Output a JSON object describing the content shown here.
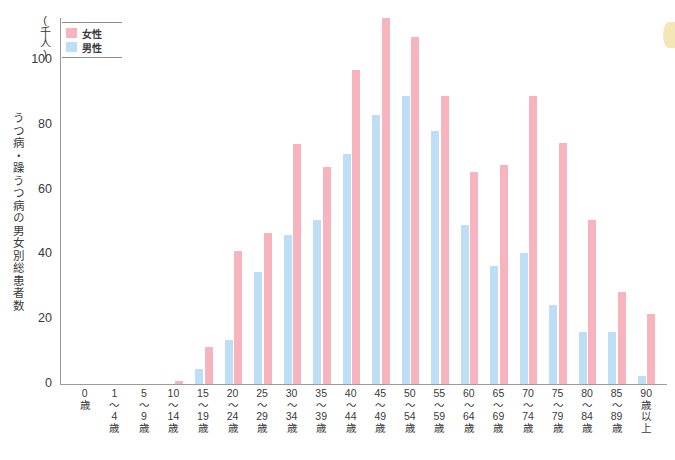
{
  "chart_data": {
    "type": "bar",
    "title": "",
    "ylabel": "うつ病・躁うつ病の男女別総患者数",
    "yunit": "(千人)",
    "xlabel": "",
    "ylim": [
      0,
      113
    ],
    "yticks": [
      "0",
      "20",
      "40",
      "60",
      "80",
      "100"
    ],
    "grid": false,
    "legend_position": "top-left",
    "categories": [
      "0歳",
      "1〜4歳",
      "5〜9歳",
      "10〜14歳",
      "15〜19歳",
      "20〜24歳",
      "25〜29歳",
      "30〜34歳",
      "35〜39歳",
      "40〜44歳",
      "45〜49歳",
      "50〜54歳",
      "55〜59歳",
      "60〜64歳",
      "65〜69歳",
      "70〜74歳",
      "75〜79歳",
      "80〜84歳",
      "85〜89歳",
      "90歳以上"
    ],
    "category_lines": [
      [
        "0",
        "歳"
      ],
      [
        "1",
        "〜",
        "4",
        "歳"
      ],
      [
        "5",
        "〜",
        "9",
        "歳"
      ],
      [
        "10",
        "〜",
        "14",
        "歳"
      ],
      [
        "15",
        "〜",
        "19",
        "歳"
      ],
      [
        "20",
        "〜",
        "24",
        "歳"
      ],
      [
        "25",
        "〜",
        "29",
        "歳"
      ],
      [
        "30",
        "〜",
        "34",
        "歳"
      ],
      [
        "35",
        "〜",
        "39",
        "歳"
      ],
      [
        "40",
        "〜",
        "44",
        "歳"
      ],
      [
        "45",
        "〜",
        "49",
        "歳"
      ],
      [
        "50",
        "〜",
        "54",
        "歳"
      ],
      [
        "55",
        "〜",
        "59",
        "歳"
      ],
      [
        "60",
        "〜",
        "64",
        "歳"
      ],
      [
        "65",
        "〜",
        "69",
        "歳"
      ],
      [
        "70",
        "〜",
        "74",
        "歳"
      ],
      [
        "75",
        "〜",
        "79",
        "歳"
      ],
      [
        "80",
        "〜",
        "84",
        "歳"
      ],
      [
        "85",
        "〜",
        "89",
        "歳"
      ],
      [
        "90",
        "歳",
        "以",
        "上"
      ]
    ],
    "series": [
      {
        "name": "女性",
        "color": "#f8b4be",
        "values": [
          0,
          0,
          0,
          1,
          11.5,
          41,
          46.5,
          74,
          67,
          97,
          113,
          107,
          89,
          65.5,
          67.5,
          89,
          74.5,
          50.5,
          28.5,
          21.5
        ]
      },
      {
        "name": "男性",
        "color": "#bedef5",
        "values": [
          0,
          0,
          0,
          0,
          4.5,
          13.5,
          34.5,
          46,
          50.5,
          71,
          83,
          89,
          78,
          49,
          36.5,
          40.5,
          24.5,
          16,
          16,
          2.5
        ]
      }
    ]
  },
  "legend": {
    "items": [
      {
        "label": "女性",
        "color": "#f8b4be"
      },
      {
        "label": "男性",
        "color": "#bedef5"
      }
    ]
  },
  "axes": {
    "y_unit_caption": "(千人)",
    "y_title": "うつ病・躁うつ病の男女別総患者数",
    "y_ticks": [
      "100",
      "80",
      "60",
      "40",
      "20",
      "0"
    ]
  }
}
